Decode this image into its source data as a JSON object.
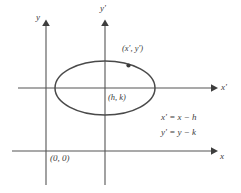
{
  "figure": {
    "background_color": "#ffffff",
    "line_color": "#555555",
    "curve_color": "#4a4a4a",
    "text_color": "#3b3b3b",
    "width": 241,
    "height": 193
  },
  "axes": {
    "original": {
      "x_label": "x",
      "y_label": "y",
      "origin_label": "(0, 0)",
      "origin_x": 46,
      "origin_y": 151
    },
    "translated": {
      "x_label": "x'",
      "y_label": "y'",
      "origin_x": 105,
      "origin_y": 88
    }
  },
  "ellipse": {
    "center_label": "(h, k)",
    "center_x": 105,
    "center_y": 88,
    "radius_x": 50,
    "radius_y": 27
  },
  "point": {
    "label": "(x', y')",
    "x": 128,
    "y": 66
  },
  "equations": [
    "x' = x − h",
    "y' = y − k"
  ]
}
